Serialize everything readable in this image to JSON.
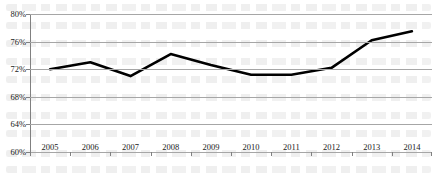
{
  "chart_data": {
    "type": "line",
    "title": "",
    "subtitle": "",
    "xlabel": "",
    "ylabel": "",
    "categories": [
      "2005",
      "2006",
      "2007",
      "2008",
      "2009",
      "2010",
      "2011",
      "2012",
      "2013",
      "2014"
    ],
    "values": [
      72.0,
      73.0,
      71.0,
      74.2,
      72.6,
      71.2,
      71.2,
      72.2,
      76.2,
      77.5
    ],
    "series": [
      {
        "name": "",
        "values": [
          72.0,
          73.0,
          71.0,
          74.2,
          72.6,
          71.2,
          71.2,
          72.2,
          76.2,
          77.5
        ]
      }
    ],
    "ylim": [
      60,
      80
    ],
    "ytick_step": 4,
    "ytick_labels": [
      "80%",
      "76%",
      "72%",
      "68%",
      "64%",
      "60%"
    ],
    "ytick_values": [
      80,
      76,
      72,
      68,
      64,
      60
    ],
    "grid": true,
    "grid_axis": "y",
    "legend": false,
    "legend_position": "none",
    "markers": false,
    "value_unit": "%",
    "line_color": "#000000",
    "grid_color": "#a6a6a6",
    "axis_color": "#808080",
    "text_color": "#1a1a1a"
  }
}
